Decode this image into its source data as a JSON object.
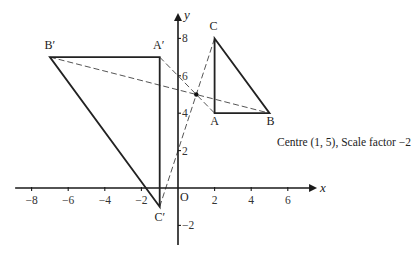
{
  "diagram": {
    "type": "enlargement",
    "caption": "Centre (1, 5), Scale factor −2",
    "centre": [
      1,
      5
    ],
    "scale_factor": -2,
    "axes": {
      "x_label": "x",
      "y_label": "y",
      "origin_label": "O",
      "x_range": [
        -8.9,
        7.6
      ],
      "y_range": [
        -3.05,
        9.36
      ],
      "x_ticks": [
        -8,
        -6,
        -4,
        -2,
        2,
        4,
        6
      ],
      "x_tick_labels": [
        "−8",
        "−6",
        "−4",
        "−2",
        "2",
        "4",
        "6"
      ],
      "y_ticks": [
        -2,
        2,
        4,
        6,
        8
      ],
      "y_tick_labels": [
        "−2",
        "2",
        "4",
        "6",
        "8"
      ],
      "grid": false
    },
    "object_triangle": {
      "name": "ABC",
      "vertices": [
        {
          "label": "A",
          "point": [
            2,
            4
          ]
        },
        {
          "label": "B",
          "point": [
            5,
            4
          ]
        },
        {
          "label": "C",
          "point": [
            2,
            8
          ]
        }
      ]
    },
    "image_triangle": {
      "name": "A'B'C'",
      "vertices": [
        {
          "label": "A'",
          "point": [
            -1,
            7
          ]
        },
        {
          "label": "B'",
          "point": [
            -7,
            7
          ]
        },
        {
          "label": "C'",
          "point": [
            -1,
            -1
          ]
        }
      ]
    },
    "construction_lines": [
      {
        "from": "A'",
        "to": "A",
        "through": [
          1,
          5
        ]
      },
      {
        "from": "B'",
        "to": "B",
        "through": [
          1,
          5
        ]
      },
      {
        "from": "C'",
        "to": "C",
        "through": [
          1,
          5
        ]
      }
    ]
  }
}
